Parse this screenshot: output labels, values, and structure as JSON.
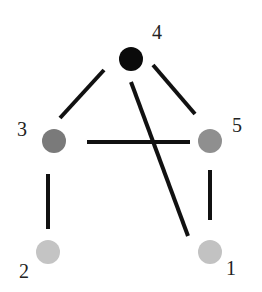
{
  "diagram": {
    "type": "graph",
    "nodes": [
      {
        "id": "1",
        "label": "1",
        "x": 210,
        "y": 250,
        "color": "#c2c2c2"
      },
      {
        "id": "2",
        "label": "2",
        "x": 48,
        "y": 251,
        "color": "#c4c4c4"
      },
      {
        "id": "3",
        "label": "3",
        "x": 55,
        "y": 140,
        "color": "#7a7a7a"
      },
      {
        "id": "4",
        "label": "4",
        "x": 131,
        "y": 60,
        "color": "#0a0a0a"
      },
      {
        "id": "5",
        "label": "5",
        "x": 211,
        "y": 140,
        "color": "#8f8f8f"
      }
    ],
    "edges": [
      {
        "from": "4",
        "to": "3"
      },
      {
        "from": "4",
        "to": "5"
      },
      {
        "from": "4",
        "to": "1"
      },
      {
        "from": "3",
        "to": "5"
      },
      {
        "from": "3",
        "to": "2"
      },
      {
        "from": "5",
        "to": "1"
      }
    ]
  }
}
